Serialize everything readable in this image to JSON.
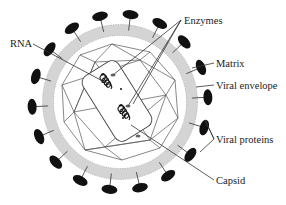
{
  "diagram": {
    "labels": [
      {
        "id": "rna",
        "text": "RNA"
      },
      {
        "id": "enzymes",
        "text": "Enzymes"
      },
      {
        "id": "matrix",
        "text": "Matrix"
      },
      {
        "id": "viral-envelope",
        "text": "Viral envelope"
      },
      {
        "id": "viral-proteins",
        "text": "Viral proteins"
      },
      {
        "id": "capsid",
        "text": "Capsid"
      }
    ],
    "spike_count": 18,
    "colors": {
      "spike": "#111111",
      "envelope": "#d4d4d4",
      "lines": "#555555",
      "text": "#222222"
    }
  }
}
